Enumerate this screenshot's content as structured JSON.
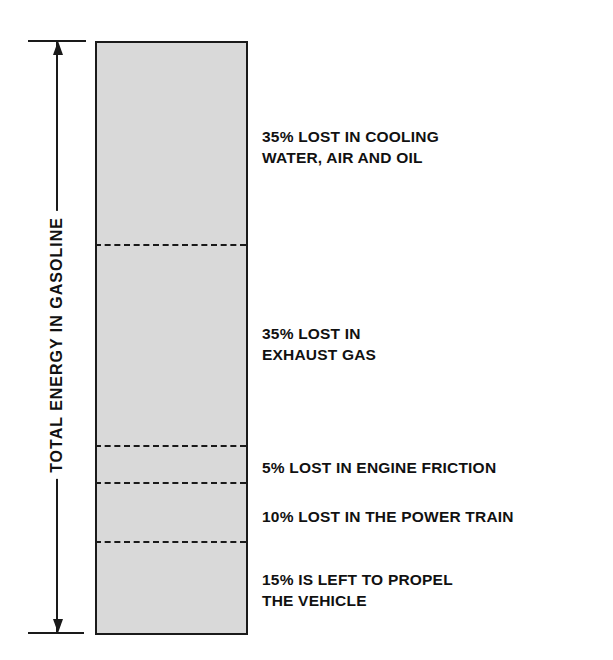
{
  "diagram": {
    "axis_label": "TOTAL ENERGY IN GASOLINE",
    "segments": [
      {
        "percent": 35,
        "line1": "35% LOST IN COOLING",
        "line2": "WATER, AIR AND OIL"
      },
      {
        "percent": 35,
        "line1": "35% LOST IN",
        "line2": "EXHAUST GAS"
      },
      {
        "percent": 5,
        "line1": "5% LOST IN ENGINE FRICTION"
      },
      {
        "percent": 10,
        "line1": "10% LOST IN THE POWER TRAIN"
      },
      {
        "percent": 15,
        "line1": "15% IS LEFT TO PROPEL",
        "line2": "THE VEHICLE"
      }
    ],
    "colors": {
      "fill": "#d9d9d9",
      "stroke": "#1a1a1a"
    }
  }
}
